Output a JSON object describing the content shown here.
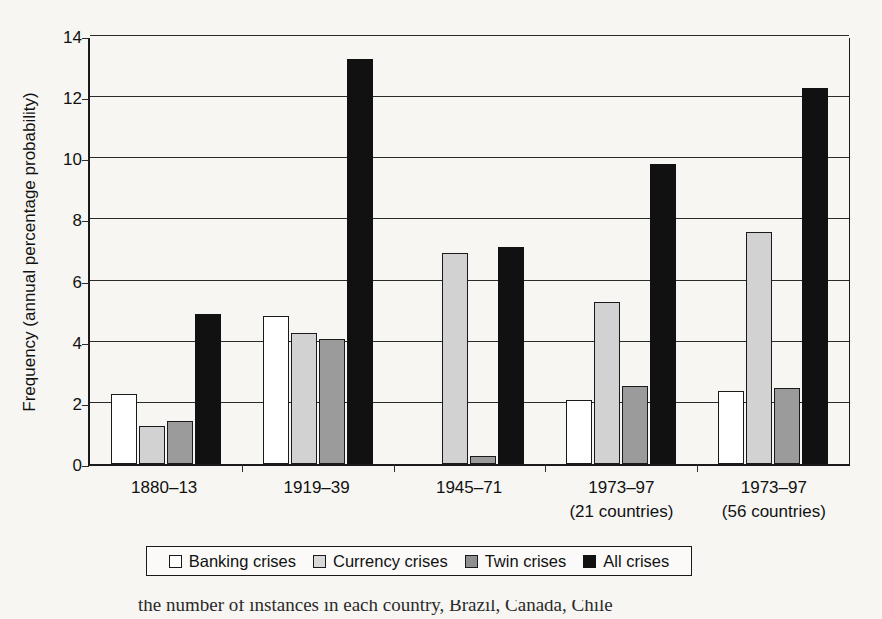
{
  "chart_data": {
    "type": "bar",
    "title": "",
    "xlabel": "",
    "ylabel": "Frequency (annual percentage probability)",
    "ylim": [
      0,
      14
    ],
    "yticks": [
      0,
      2,
      4,
      6,
      8,
      10,
      12,
      14
    ],
    "grid": true,
    "legend_position": "bottom",
    "categories": [
      "1880–13",
      "1919–39",
      "1945–71",
      "1973–97",
      "1973–97"
    ],
    "category_sublabels": [
      "",
      "",
      "",
      "(21 countries)",
      "(56 countries)"
    ],
    "series": [
      {
        "name": "Banking crises",
        "color": "#ffffff",
        "values": [
          2.3,
          4.85,
          0.0,
          2.1,
          2.4
        ]
      },
      {
        "name": "Currency crises",
        "color": "#d2d2d2",
        "values": [
          1.25,
          4.3,
          6.9,
          5.3,
          7.6
        ]
      },
      {
        "name": "Twin crises",
        "color": "#9b9b9b",
        "values": [
          1.4,
          4.1,
          0.25,
          2.55,
          2.5
        ]
      },
      {
        "name": "All crises",
        "color": "#111111",
        "values": [
          4.9,
          13.25,
          7.1,
          9.8,
          12.3
        ]
      }
    ]
  },
  "axis": {
    "y_title": "Frequency (annual percentage probability)",
    "y_tick_labels": [
      "0",
      "2",
      "4",
      "6",
      "8",
      "10",
      "12",
      "14"
    ]
  },
  "x_axis": {
    "groups": [
      {
        "line1": "1880–13",
        "line2": ""
      },
      {
        "line1": "1919–39",
        "line2": ""
      },
      {
        "line1": "1945–71",
        "line2": ""
      },
      {
        "line1": "1973–97",
        "line2": "(21 countries)"
      },
      {
        "line1": "1973–97",
        "line2": "(56 countries)"
      }
    ]
  },
  "legend": {
    "items": [
      {
        "label": "Banking crises",
        "swatch": "white-square-icon"
      },
      {
        "label": "Currency crises",
        "swatch": "light-gray-square-icon"
      },
      {
        "label": "Twin crises",
        "swatch": "medium-gray-square-icon"
      },
      {
        "label": "All crises",
        "swatch": "black-square-icon"
      }
    ]
  },
  "caption": {
    "text": "the number of instances in each country, Brazil, Canada, Chile"
  }
}
